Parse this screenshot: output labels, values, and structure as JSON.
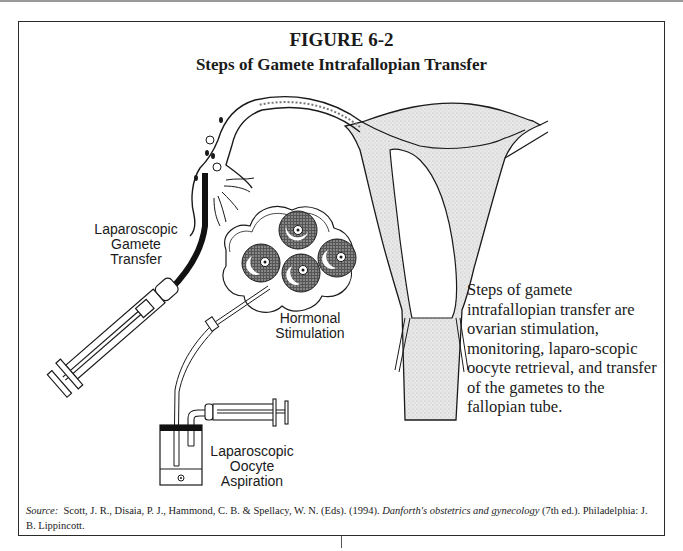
{
  "figure": {
    "number_label": "FIGURE 6-2",
    "title": "Steps of Gamete Intrafallopian Transfer"
  },
  "illustration": {
    "labels": {
      "gamete_transfer": [
        "Laparoscopic",
        "Gamete",
        "Transfer"
      ],
      "hormonal_stimulation": [
        "Hormonal",
        "Stimulation"
      ],
      "oocyte_aspiration": [
        "Laparoscopic",
        "Oocyte",
        "Aspiration"
      ]
    },
    "parts": [
      "uterus",
      "fallopian-tube",
      "fimbriae",
      "ovary-follicles",
      "transfer-catheter",
      "transfer-syringe",
      "aspiration-needle",
      "collection-vial",
      "aspiration-syringe"
    ]
  },
  "caption": "Steps of gamete intrafallopian transfer are ovarian stimulation, monitoring, laparo-scopic oocyte retrieval, and transfer of the gametes to the fallopian tube.",
  "source": {
    "prefix": "Source:",
    "authors": "Scott, J. R., Disaia, P. J., Hammond, C. B. & Spellacy, W. N. (Eds). (1994).",
    "book_title": "Danforth's obstetrics and gynecology",
    "rest": "(7th ed.). Philadelphia: J. B. Lippincott."
  }
}
